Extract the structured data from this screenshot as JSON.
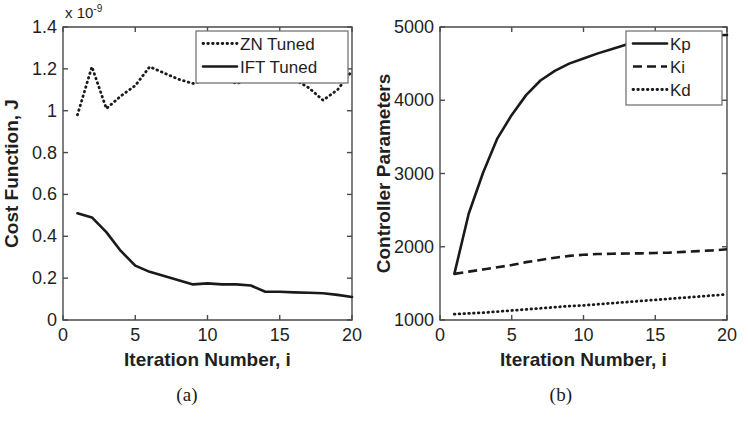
{
  "figure": {
    "panels": [
      {
        "caption": "(a)",
        "chart_index": 0
      },
      {
        "caption": "(b)",
        "chart_index": 1
      }
    ]
  },
  "chart_data": [
    {
      "type": "line",
      "title": "",
      "xlabel": "Iteration Number, i",
      "ylabel": "Cost Function, J",
      "y_exponent_label": "x 10",
      "y_exponent_power": "-9",
      "xlim": [
        0,
        20
      ],
      "ylim": [
        0,
        1.4
      ],
      "xticks": [
        0,
        5,
        10,
        15,
        20
      ],
      "xtick_labels": [
        "0",
        "5",
        "10",
        "15",
        "20"
      ],
      "yticks": [
        0,
        0.2,
        0.4,
        0.6,
        0.8,
        1,
        1.2,
        1.4
      ],
      "ytick_labels": [
        "0",
        "0.2",
        "0.4",
        "0.6",
        "0.8",
        "1",
        "1.2",
        "1.4"
      ],
      "grid": false,
      "legend_position": "top-right",
      "x": [
        1,
        2,
        3,
        4,
        5,
        6,
        7,
        8,
        9,
        10,
        11,
        12,
        13,
        14,
        15,
        16,
        17,
        18,
        19,
        20
      ],
      "series": [
        {
          "name": "ZN Tuned",
          "style": "dotted",
          "color": "#1a1a1a",
          "values": [
            0.98,
            1.21,
            1.01,
            1.07,
            1.12,
            1.21,
            1.18,
            1.15,
            1.13,
            1.15,
            1.16,
            1.13,
            1.15,
            1.16,
            1.16,
            1.15,
            1.11,
            1.05,
            1.1,
            1.19
          ]
        },
        {
          "name": "IFT Tuned",
          "style": "solid",
          "color": "#1a1a1a",
          "values": [
            0.51,
            0.49,
            0.42,
            0.33,
            0.26,
            0.23,
            0.21,
            0.19,
            0.17,
            0.175,
            0.17,
            0.17,
            0.165,
            0.135,
            0.135,
            0.132,
            0.13,
            0.128,
            0.12,
            0.11
          ]
        }
      ]
    },
    {
      "type": "line",
      "title": "",
      "xlabel": "Iteration Number, i",
      "ylabel": "Controller Parameters",
      "xlim": [
        0,
        20
      ],
      "ylim": [
        1000,
        5000
      ],
      "xticks": [
        0,
        5,
        10,
        15,
        20
      ],
      "xtick_labels": [
        "0",
        "5",
        "10",
        "15",
        "20"
      ],
      "yticks": [
        1000,
        2000,
        3000,
        4000,
        5000
      ],
      "ytick_labels": [
        "1000",
        "2000",
        "3000",
        "4000",
        "5000"
      ],
      "grid": false,
      "legend_position": "top-right",
      "x": [
        1,
        2,
        3,
        4,
        5,
        6,
        7,
        8,
        9,
        10,
        11,
        12,
        13,
        14,
        15,
        16,
        17,
        18,
        19,
        20
      ],
      "series": [
        {
          "name": "Kp",
          "style": "solid",
          "color": "#1a1a1a",
          "values": [
            1630,
            2450,
            3010,
            3480,
            3800,
            4070,
            4270,
            4400,
            4500,
            4570,
            4640,
            4700,
            4760,
            4810,
            4860,
            4870,
            4875,
            4880,
            4885,
            4890
          ]
        },
        {
          "name": "Ki",
          "style": "dashed",
          "color": "#1a1a1a",
          "values": [
            1630,
            1660,
            1690,
            1720,
            1750,
            1790,
            1820,
            1850,
            1875,
            1890,
            1900,
            1905,
            1908,
            1910,
            1915,
            1920,
            1930,
            1940,
            1950,
            1965
          ]
        },
        {
          "name": "Kd",
          "style": "dotted",
          "color": "#1a1a1a",
          "values": [
            1080,
            1090,
            1100,
            1115,
            1130,
            1145,
            1160,
            1175,
            1190,
            1200,
            1215,
            1230,
            1245,
            1260,
            1275,
            1290,
            1305,
            1320,
            1335,
            1350
          ]
        }
      ]
    }
  ]
}
